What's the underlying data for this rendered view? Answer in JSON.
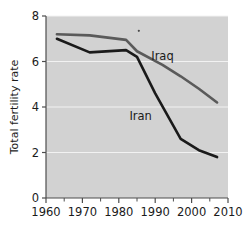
{
  "chart_data": {
    "type": "line",
    "title": "",
    "subtitle": "",
    "xlabel": "",
    "ylabel": "Total fertility rate",
    "xlim": [
      1960,
      2010
    ],
    "ylim": [
      0,
      8
    ],
    "xticks": [
      1960,
      1970,
      1980,
      1990,
      2000,
      2010
    ],
    "xtick_labels": [
      "1960",
      "1970",
      "1980",
      "1990",
      "2000",
      "2010"
    ],
    "xminor_ticks": [
      1965,
      1975,
      1985,
      1995,
      2005
    ],
    "yticks": [
      0,
      2,
      4,
      6,
      8
    ],
    "ytick_labels": [
      "0",
      "2",
      "4",
      "6",
      "8"
    ],
    "grid": "horizontal-only",
    "grid_color": "#f2f2f2",
    "plot_background": "#d2d2d2",
    "page_background": "#ffffff",
    "legend_position": "inline-annotations",
    "series": [
      {
        "name": "Iraq",
        "color": "#5a5a5a",
        "label_x": 1992,
        "label_y": 6.05,
        "x": [
          1963,
          1972,
          1982,
          1985,
          1992,
          1997,
          2002,
          2007
        ],
        "values": [
          7.2,
          7.15,
          6.95,
          6.45,
          5.85,
          5.35,
          4.8,
          4.2
        ]
      },
      {
        "name": "Iran",
        "color": "#1a1a1a",
        "label_x": 1986,
        "label_y": 3.45,
        "x": [
          1963,
          1972,
          1982,
          1985,
          1990,
          1997,
          2002,
          2007
        ],
        "values": [
          7.0,
          6.4,
          6.5,
          6.2,
          4.6,
          2.6,
          2.1,
          1.8
        ]
      }
    ],
    "annotations": [
      {
        "name": "speck",
        "x": 1985.5,
        "y": 7.35
      }
    ]
  }
}
